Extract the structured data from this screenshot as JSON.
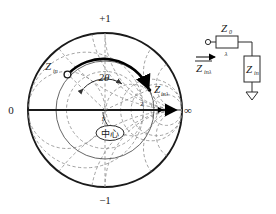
{
  "figure": {
    "type": "smith-chart-diagram"
  },
  "smith_chart": {
    "axis_labels": {
      "top": "+1",
      "bottom": "−1",
      "left": "0",
      "right": "∞"
    },
    "center_label": "中心",
    "angle_label": "2θ",
    "point_start_label": "Z",
    "point_start_sub": "in",
    "point_end_label": "Z",
    "point_end_sub": "inλ",
    "resistance_ticks": [
      "1",
      "2"
    ],
    "colors": {
      "outline": "#1a1a1a",
      "grid": "#7a7a7a",
      "bold_path": "#000000",
      "vswr_circle": "#555555"
    }
  },
  "circuit": {
    "source_terminal": "○",
    "line_box_label": "Z",
    "line_box_sub": "0",
    "line_length_label": "λ",
    "load_box_label": "Z",
    "load_box_sub": "in",
    "input_arrow_label": "Z",
    "input_arrow_sub": "inλ",
    "ground_symbol": "▽"
  }
}
